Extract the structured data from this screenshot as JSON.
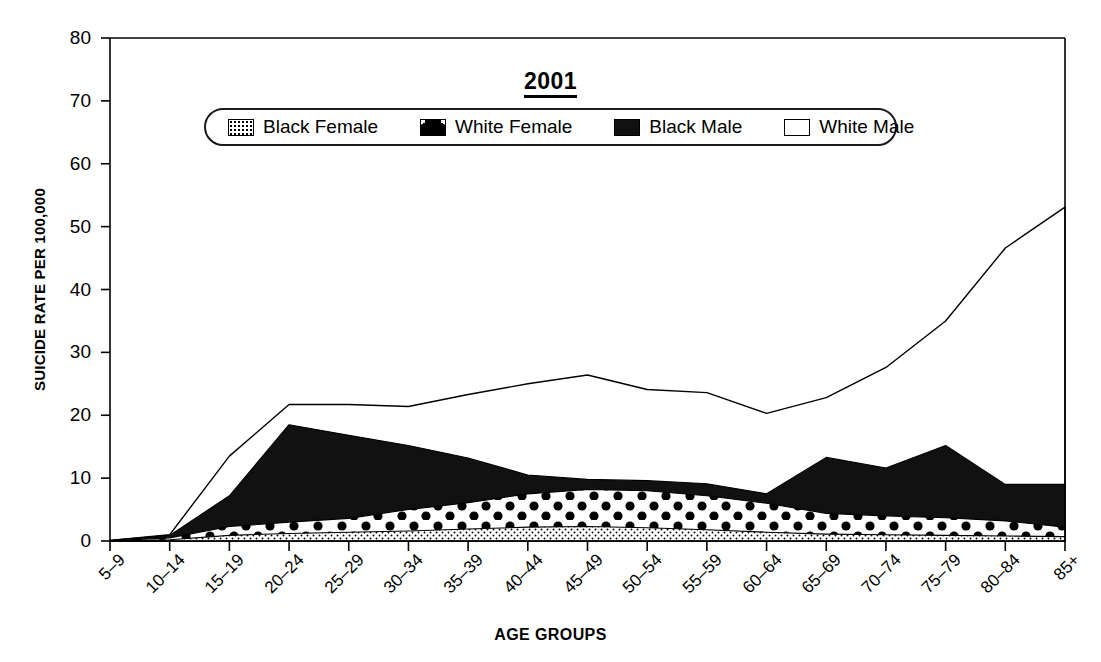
{
  "chart_data": {
    "type": "area",
    "title": "2001",
    "xlabel": "AGE GROUPS",
    "ylabel": "SUICIDE RATE PER 100,000",
    "ylim": [
      0,
      80
    ],
    "yticks": [
      0,
      10,
      20,
      30,
      40,
      50,
      60,
      70,
      80
    ],
    "grid": false,
    "legend_position": "top-center",
    "overlap_mode": "overlaid-areas",
    "categories": [
      "5–9",
      "10–14",
      "15–19",
      "20–24",
      "25–29",
      "30–34",
      "35–39",
      "40–44",
      "45–49",
      "50–54",
      "55–59",
      "60–64",
      "65–69",
      "70–74",
      "75–79",
      "80–84",
      "85+"
    ],
    "series": [
      {
        "name": "White Male",
        "fill": "open",
        "values": [
          0.1,
          1.0,
          13.5,
          21.7,
          21.7,
          21.4,
          23.3,
          25.0,
          26.4,
          24.1,
          23.6,
          20.3,
          22.8,
          27.6,
          35.0,
          46.6,
          53.1
        ]
      },
      {
        "name": "Black Male",
        "fill": "solid-black",
        "values": [
          0.1,
          0.9,
          7.2,
          18.5,
          16.8,
          15.2,
          13.2,
          10.5,
          9.8,
          9.6,
          9.1,
          7.5,
          13.3,
          11.6,
          15.2,
          9.0,
          9.0
        ]
      },
      {
        "name": "White Female",
        "fill": "large-dots",
        "values": [
          0.05,
          0.5,
          2.3,
          3.0,
          3.6,
          5.0,
          6.1,
          7.5,
          8.2,
          8.0,
          7.2,
          6.0,
          4.4,
          4.0,
          3.7,
          3.2,
          2.2
        ]
      },
      {
        "name": "Black Female",
        "fill": "fine-dots",
        "values": [
          0.02,
          0.2,
          0.9,
          1.2,
          1.4,
          1.6,
          1.9,
          2.2,
          2.3,
          2.1,
          1.8,
          1.4,
          1.1,
          1.0,
          0.9,
          0.8,
          0.7
        ]
      }
    ]
  },
  "legend": {
    "items": [
      {
        "label": "Black Female",
        "swatch": "fine-dots-swatch"
      },
      {
        "label": "White Female",
        "swatch": "large-dots-swatch"
      },
      {
        "label": "Black Male",
        "swatch": "solid-black-swatch"
      },
      {
        "label": "White Male",
        "swatch": "open-swatch"
      }
    ]
  },
  "colors": {
    "axis": "#000000",
    "series_black_male": "#111111",
    "background": "#ffffff"
  }
}
